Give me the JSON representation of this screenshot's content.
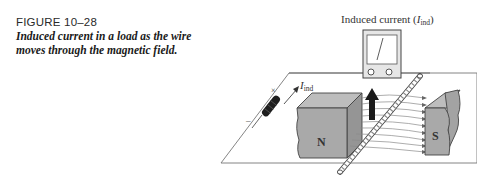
{
  "caption": {
    "figure_number": "FIGURE 10–28",
    "title_line1": "Induced current in a load as the wire",
    "title_line2": "moves through the magnetic field."
  },
  "diagram": {
    "meter_label_prefix": "Induced current (",
    "meter_label_var": "I",
    "meter_label_sub": "ind",
    "meter_label_suffix": ")",
    "current_arrow_var": "I",
    "current_arrow_sub": "ind",
    "load_plus": "×",
    "load_minus": "–",
    "north_pole": "N",
    "south_pole": "S",
    "colors": {
      "magnet_face": "#a9a9a9",
      "magnet_top": "#bdbdbd",
      "magnet_side": "#959595",
      "line": "#555555",
      "resistor": "#1e1e1e",
      "field_line": "#8a8a8a"
    }
  }
}
